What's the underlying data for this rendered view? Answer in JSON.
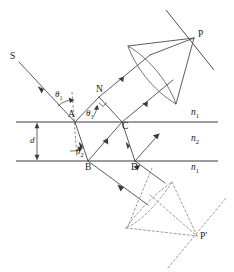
{
  "labels": {
    "source": "S",
    "normal_point": "N",
    "point_a": "A",
    "point_b": "B",
    "point_c": "C",
    "point_d": "D",
    "focus_p": "P",
    "focus_p_prime": "P′",
    "thickness": "d"
  },
  "angles": {
    "incidence": "θ",
    "incidence_sub": "1",
    "internal_upper": "θ",
    "internal_upper_sub": "1",
    "refraction": "θ",
    "refraction_sub": "2"
  },
  "media": {
    "upper": "n",
    "upper_sub": "1",
    "film": "n",
    "film_sub": "2",
    "lower": "n",
    "lower_sub": "1"
  },
  "colors": {
    "ray": "#4a4a52",
    "interface": "#3a3a40",
    "ghost": "#8b8b92",
    "normal": "#6b6b72",
    "text": "#1a1a1a",
    "background": "#ffffff"
  },
  "geometry": {
    "upper_interface_y": 122,
    "lower_interface_y": 161,
    "point_a_x": 75,
    "point_b_x": 88,
    "point_c_x": 122,
    "point_d_x": 135,
    "focus_p": [
      194,
      38
    ],
    "focus_p_prime": [
      197,
      236
    ]
  }
}
